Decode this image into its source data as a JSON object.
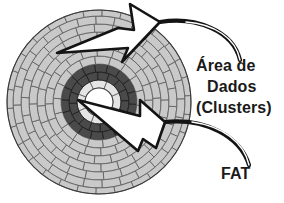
{
  "figure": {
    "kind": "disk-platter-diagram",
    "background": "#ffffff",
    "ink": "#1a1a1a"
  },
  "labels": {
    "area": "Área de",
    "dados": "Dados",
    "clusters": "(Clusters)",
    "fat": "FAT"
  },
  "disk": {
    "center_x": 99,
    "center_y": 102,
    "outer_radius": 92,
    "hub_radius": 14,
    "colors": {
      "data_fill": "#c9c9c9",
      "data_stroke": "#5a5a5a",
      "fat_fill": "#4a4a4a",
      "fat_stroke": "#1f1f1f",
      "hub_fill": "#ffffff",
      "inner_ring_fill": "#e4e4e4",
      "outline": "#3a3a3a"
    },
    "rings": [
      {
        "name": "hub",
        "r_inner": 0,
        "r_outer": 14,
        "band": "hub",
        "sectors": 0
      },
      {
        "name": "inner-ring",
        "r_inner": 14,
        "r_outer": 22,
        "band": "data",
        "sectors": 8
      },
      {
        "name": "fat-1",
        "r_inner": 22,
        "r_outer": 30,
        "band": "fat",
        "sectors": 16
      },
      {
        "name": "fat-2",
        "r_inner": 30,
        "r_outer": 38,
        "band": "fat",
        "sectors": 18
      },
      {
        "name": "data-1",
        "r_inner": 38,
        "r_outer": 46,
        "band": "data",
        "sectors": 18
      },
      {
        "name": "data-2",
        "r_inner": 46,
        "r_outer": 54,
        "band": "data",
        "sectors": 20
      },
      {
        "name": "data-3",
        "r_inner": 54,
        "r_outer": 62,
        "band": "data",
        "sectors": 22
      },
      {
        "name": "data-4",
        "r_inner": 62,
        "r_outer": 70,
        "band": "data",
        "sectors": 24
      },
      {
        "name": "data-5",
        "r_inner": 70,
        "r_outer": 78,
        "band": "data",
        "sectors": 26
      },
      {
        "name": "data-6",
        "r_inner": 78,
        "r_outer": 86,
        "band": "data",
        "sectors": 28
      },
      {
        "name": "data-7",
        "r_inner": 86,
        "r_outer": 92,
        "band": "data",
        "sectors": 30
      }
    ]
  },
  "callouts": [
    {
      "name": "data-area-arrow",
      "points_to": "Área de Dados (Clusters)",
      "tip_x": 57,
      "tip_y": 53
    },
    {
      "name": "fat-arrow",
      "points_to": "FAT",
      "tip_x": 78,
      "tip_y": 100
    }
  ]
}
